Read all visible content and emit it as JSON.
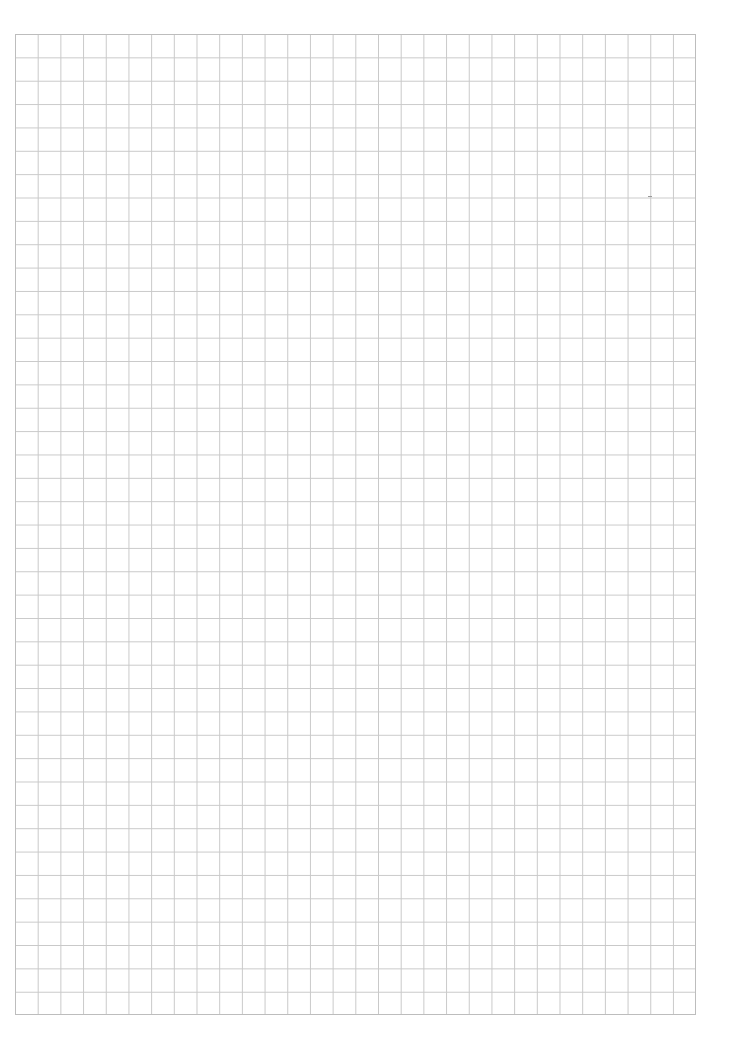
{
  "page": {
    "type": "graph-paper",
    "background_color": "#ffffff",
    "grid": {
      "columns": 30,
      "rows": 42,
      "line_color": "#c9c9c9",
      "border_color": "#bdbdbd"
    },
    "marks": [
      {
        "name": "speck-1",
        "x": 648,
        "y": 196
      }
    ]
  }
}
